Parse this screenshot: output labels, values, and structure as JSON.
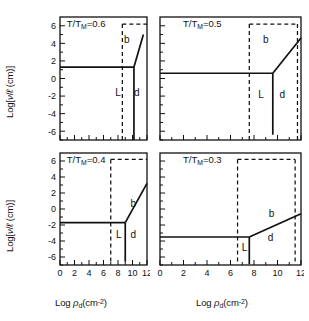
{
  "figure": {
    "axis": {
      "xlabel_main": "Log",
      "xlabel_rho": "ρ",
      "xlabel_rho_sub": "d",
      "xlabel_units": "(cm",
      "xlabel_units_sup": "-2",
      "xlabel_units_close": ")",
      "ylabel_open": "Log[",
      "ylabel_nu": "ν",
      "ylabel_slash": "/",
      "ylabel_ell": "ℓ",
      "ylabel_units": " (cm)]",
      "x_ticks": [
        "0",
        "2",
        "4",
        "6",
        "8",
        "10",
        "12"
      ],
      "y_ticks": [
        "6",
        "4",
        "2",
        "0",
        "-2",
        "-4",
        "-6"
      ],
      "xlim": [
        0,
        12
      ],
      "ylim": [
        -7,
        7
      ]
    },
    "region_labels": {
      "b": "b",
      "L": "L",
      "d": "d"
    },
    "colors": {
      "line": "#111111",
      "background": "#ffffff"
    }
  },
  "chart_data": [
    {
      "type": "line",
      "panel_id": "top-left",
      "title": "T/T",
      "title_sub": "M",
      "title_value": "=0.6",
      "xlabel": "Log ρ_d (cm^-2)",
      "ylabel": "Log[ν/ℓ (cm)]",
      "xlim": [
        0,
        12
      ],
      "ylim": [
        -7,
        7
      ],
      "grid": false,
      "show_x_ticklabels": false,
      "show_y_ticklabels": true,
      "regions": [
        {
          "label": "b",
          "x": 9.2,
          "y": 4.0
        },
        {
          "label": "L",
          "x": 8.0,
          "y": -2.0
        },
        {
          "label": "d",
          "x": 10.6,
          "y": -2.0
        }
      ],
      "solid_curves": [
        {
          "name": "horizontal-boundary",
          "points": [
            [
              0,
              1.3
            ],
            [
              10.2,
              1.3
            ]
          ]
        },
        {
          "name": "upper-right-branch",
          "points": [
            [
              10.2,
              1.3
            ],
            [
              11.5,
              5.0
            ]
          ]
        },
        {
          "name": "vertical-boundary",
          "points": [
            [
              10.2,
              1.3
            ],
            [
              10.2,
              -7.0
            ]
          ]
        }
      ],
      "dashed_curves": [
        {
          "name": "dashed-vertical",
          "points": [
            [
              8.6,
              6.2
            ],
            [
              8.6,
              -7.0
            ]
          ]
        },
        {
          "name": "dashed-horizontal-top",
          "points": [
            [
              8.6,
              6.2
            ],
            [
              12.0,
              6.2
            ]
          ]
        }
      ]
    },
    {
      "type": "line",
      "panel_id": "top-right",
      "title": "T/T",
      "title_sub": "M",
      "title_value": "=0.5",
      "xlabel": "Log ρ_d (cm^-2)",
      "ylabel": "",
      "xlim": [
        0,
        12
      ],
      "ylim": [
        -7,
        7
      ],
      "grid": false,
      "show_x_ticklabels": false,
      "show_y_ticklabels": false,
      "regions": [
        {
          "label": "b",
          "x": 9.0,
          "y": 4.0
        },
        {
          "label": "L",
          "x": 8.6,
          "y": -2.2
        },
        {
          "label": "d",
          "x": 10.4,
          "y": -2.2
        }
      ],
      "solid_curves": [
        {
          "name": "horizontal-boundary",
          "points": [
            [
              0,
              0.6
            ],
            [
              9.6,
              0.6
            ]
          ]
        },
        {
          "name": "upper-right-branch",
          "points": [
            [
              9.6,
              0.6
            ],
            [
              12.0,
              4.6
            ]
          ]
        },
        {
          "name": "vertical-boundary",
          "points": [
            [
              9.6,
              0.6
            ],
            [
              9.6,
              -6.4
            ]
          ]
        }
      ],
      "dashed_curves": [
        {
          "name": "dashed-vertical",
          "points": [
            [
              7.6,
              6.2
            ],
            [
              7.6,
              -7.0
            ]
          ]
        },
        {
          "name": "dashed-horizontal-top",
          "points": [
            [
              7.6,
              6.2
            ],
            [
              11.7,
              6.2
            ]
          ]
        },
        {
          "name": "dashed-right-vertical",
          "points": [
            [
              11.7,
              6.2
            ],
            [
              11.7,
              -7.0
            ]
          ]
        }
      ]
    },
    {
      "type": "line",
      "panel_id": "bottom-left",
      "title": "T/T",
      "title_sub": "M",
      "title_value": "=0.4",
      "xlabel": "Log ρ_d (cm^-2)",
      "ylabel": "Log[ν/ℓ (cm)]",
      "xlim": [
        0,
        12
      ],
      "ylim": [
        -7,
        7
      ],
      "grid": false,
      "show_x_ticklabels": true,
      "show_y_ticklabels": true,
      "regions": [
        {
          "label": "b",
          "x": 10.1,
          "y": 0.2
        },
        {
          "label": "L",
          "x": 8.1,
          "y": -3.6
        },
        {
          "label": "d",
          "x": 10.1,
          "y": -3.6
        }
      ],
      "solid_curves": [
        {
          "name": "horizontal-boundary",
          "points": [
            [
              0,
              -1.7
            ],
            [
              9.0,
              -1.7
            ]
          ]
        },
        {
          "name": "upper-right-branch",
          "points": [
            [
              9.0,
              -1.7
            ],
            [
              12.0,
              3.2
            ]
          ]
        },
        {
          "name": "vertical-boundary",
          "points": [
            [
              9.0,
              -1.7
            ],
            [
              9.0,
              -6.6
            ]
          ]
        }
      ],
      "dashed_curves": [
        {
          "name": "dashed-vertical",
          "points": [
            [
              7.0,
              6.2
            ],
            [
              7.0,
              -6.9
            ]
          ]
        },
        {
          "name": "dashed-horizontal-top",
          "points": [
            [
              7.0,
              6.2
            ],
            [
              12.0,
              6.2
            ]
          ]
        }
      ]
    },
    {
      "type": "line",
      "panel_id": "bottom-right",
      "title": "T/T",
      "title_sub": "M",
      "title_value": "=0.3",
      "xlabel": "Log ρ_d (cm^-2)",
      "ylabel": "",
      "xlim": [
        0,
        12
      ],
      "ylim": [
        -7,
        7
      ],
      "grid": false,
      "show_x_ticklabels": true,
      "show_y_ticklabels": false,
      "regions": [
        {
          "label": "b",
          "x": 9.5,
          "y": -1.0
        },
        {
          "label": "L",
          "x": 7.2,
          "y": -5.2
        },
        {
          "label": "d",
          "x": 9.4,
          "y": -4.0
        }
      ],
      "solid_curves": [
        {
          "name": "horizontal-boundary",
          "points": [
            [
              0,
              -3.5
            ],
            [
              7.6,
              -3.5
            ]
          ]
        },
        {
          "name": "upper-right-branch",
          "points": [
            [
              7.6,
              -3.5
            ],
            [
              12.0,
              -0.6
            ]
          ]
        },
        {
          "name": "vertical-boundary",
          "points": [
            [
              7.6,
              -3.5
            ],
            [
              7.6,
              -6.9
            ]
          ]
        }
      ],
      "dashed_curves": [
        {
          "name": "dashed-vertical",
          "points": [
            [
              6.6,
              6.2
            ],
            [
              6.6,
              -6.9
            ]
          ]
        },
        {
          "name": "dashed-horizontal-top",
          "points": [
            [
              6.6,
              6.2
            ],
            [
              11.5,
              6.2
            ]
          ]
        },
        {
          "name": "dashed-right-vertical",
          "points": [
            [
              11.5,
              6.2
            ],
            [
              11.5,
              -6.9
            ]
          ]
        }
      ]
    }
  ]
}
